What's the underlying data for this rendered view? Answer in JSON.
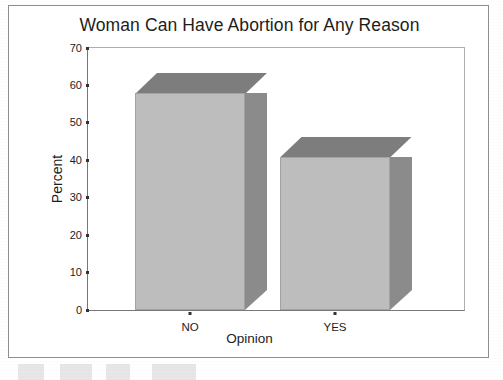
{
  "chart_data": {
    "type": "bar",
    "title": "Woman Can Have Abortion for Any Reason",
    "xlabel": "Opinion",
    "ylabel": "Percent",
    "categories": [
      "NO",
      "YES"
    ],
    "values": [
      58,
      41
    ],
    "ylim": [
      0,
      70
    ],
    "yticks": [
      0,
      10,
      20,
      30,
      40,
      50,
      60,
      70
    ],
    "ytick_labels": [
      "0",
      "10",
      "20",
      "30",
      "40",
      "50",
      "60",
      "70"
    ],
    "grid": false,
    "legend": null,
    "style": "3d-bar",
    "colors": {
      "bar_front": "#bdbdbd",
      "bar_side": "#8b8b8b",
      "bar_top": "#7d7d7d",
      "axis": "#777777",
      "text": "#1d1d1d",
      "frame": "#8e8e8e",
      "background": "#ffffff"
    }
  }
}
